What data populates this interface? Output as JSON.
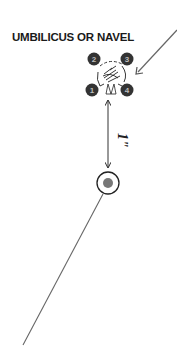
{
  "diagram": {
    "title": "UMBILICUS OR NAVEL",
    "points": [
      {
        "label": "1",
        "cx": 92,
        "cy": 90
      },
      {
        "label": "2",
        "cx": 94,
        "cy": 59
      },
      {
        "label": "3",
        "cx": 127,
        "cy": 59
      },
      {
        "label": "4",
        "cx": 127,
        "cy": 90
      }
    ],
    "measurement_label": "1\"",
    "colors": {
      "point_fill": "#333333",
      "point_text": "#bdbdbd",
      "line": "#666666",
      "target_dot": "#777777"
    }
  }
}
